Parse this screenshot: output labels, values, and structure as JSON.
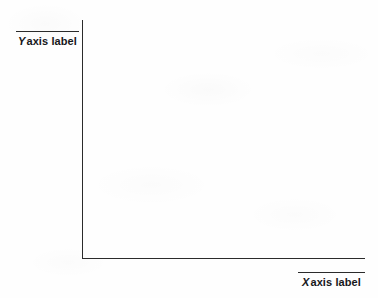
{
  "figure": {
    "type": "empty-axes-template",
    "background_color": "#fefefe",
    "axis_color": "#2b2b2b",
    "text_color": "#17171a"
  },
  "chart_data": {
    "type": "line",
    "title": "",
    "xlabel": "X axis label",
    "ylabel": "Y axis label",
    "x": [],
    "values": [],
    "series": [],
    "categories": [],
    "xlim": [],
    "ylim": [],
    "grid": false,
    "legend": false,
    "annotations": []
  },
  "axes": {
    "y": {
      "variable": "Y",
      "label": "axis label",
      "full_label": "Y axis label",
      "tick_labels": [],
      "rule_above": true
    },
    "x": {
      "variable": "X",
      "label": "axis label",
      "full_label": "X axis label",
      "tick_labels": [],
      "rule_above": true
    }
  }
}
